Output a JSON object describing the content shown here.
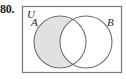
{
  "problem": {
    "number": "80."
  },
  "figure": {
    "type": "venn-diagram",
    "universal_label": "U",
    "set_a_label": "A",
    "set_b_label": "B",
    "shaded_region": "A only (A minus B)",
    "colors": {
      "shading": "#e3e2e0",
      "outline": "#6f6f6f",
      "rectangle_border": "#7a7a7a",
      "text": "#2a2a2a"
    }
  }
}
